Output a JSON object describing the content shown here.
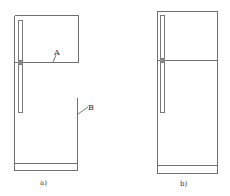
{
  "figure": {
    "panels": [
      {
        "id": "a",
        "caption": "a)",
        "labels": [
          {
            "text": "A",
            "target": "divider-line"
          },
          {
            "text": "B",
            "target": "lower-right-wall"
          }
        ]
      },
      {
        "id": "b",
        "caption": "b)",
        "labels": []
      }
    ],
    "colors": {
      "line": "#6f6f6f",
      "text": "#333333",
      "background": "#ffffff"
    }
  }
}
